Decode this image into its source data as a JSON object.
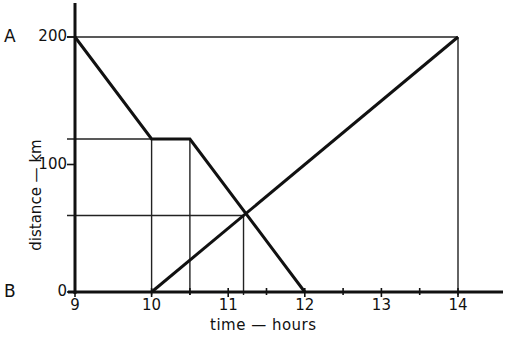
{
  "chart_data": {
    "type": "line",
    "title": "",
    "xlabel": "time — hours",
    "ylabel": "distance — km",
    "xlim": [
      9,
      14.6
    ],
    "ylim": [
      0,
      200
    ],
    "x_ticks": [
      "9",
      "10",
      "11",
      "12",
      "13",
      "14"
    ],
    "y_ticks": [
      "0",
      "100",
      "200"
    ],
    "point_labels": {
      "A": "A",
      "B": "B"
    },
    "grid": false,
    "series": [
      {
        "name": "Journey from A",
        "points": [
          [
            9,
            200
          ],
          [
            10,
            120
          ],
          [
            10.5,
            120
          ],
          [
            12,
            0
          ]
        ]
      },
      {
        "name": "Journey from B",
        "points": [
          [
            10,
            0
          ],
          [
            14,
            200
          ]
        ]
      }
    ],
    "annotations": {
      "intersection": {
        "x": 11.2,
        "y": 60
      },
      "reference_horizontal": [
        {
          "y": 200,
          "x_from": 9,
          "x_to": 14
        },
        {
          "y": 120,
          "x_from": 9,
          "x_to": 10
        },
        {
          "y": 60,
          "x_from": 9,
          "x_to": 11.2
        }
      ],
      "reference_vertical": [
        {
          "x": 10,
          "y_from": 0,
          "y_to": 120
        },
        {
          "x": 10.5,
          "y_from": 0,
          "y_to": 120
        },
        {
          "x": 11.2,
          "y_from": 0,
          "y_to": 60
        },
        {
          "x": 14,
          "y_from": 0,
          "y_to": 200
        }
      ]
    }
  }
}
